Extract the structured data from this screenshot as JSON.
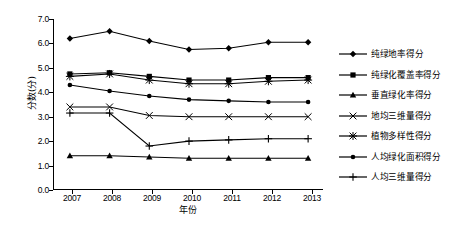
{
  "chart_data": {
    "type": "line",
    "title": "",
    "xlabel": "年份",
    "ylabel": "分数(分)",
    "categories": [
      "2007",
      "2008",
      "2009",
      "2010",
      "2011",
      "2012",
      "2013"
    ],
    "x": [
      2007,
      2008,
      2009,
      2010,
      2011,
      2012,
      2013
    ],
    "xlim": [
      2006.6,
      2013.4
    ],
    "ylim": [
      0.0,
      7.0
    ],
    "yticks": [
      "0.0",
      "1.0",
      "2.0",
      "3.0",
      "4.0",
      "5.0",
      "6.0",
      "7.0"
    ],
    "ytick_values": [
      0.0,
      1.0,
      2.0,
      3.0,
      4.0,
      5.0,
      6.0,
      7.0
    ],
    "grid": false,
    "legend_position": "right",
    "series": [
      {
        "name": "纯绿地率得分",
        "marker": "diamond",
        "values": [
          6.2,
          6.5,
          6.1,
          5.75,
          5.8,
          6.05,
          6.05
        ]
      },
      {
        "name": "纯绿化覆盖率得分",
        "marker": "square",
        "values": [
          4.75,
          4.8,
          4.65,
          4.5,
          4.5,
          4.6,
          4.6
        ]
      },
      {
        "name": "垂直绿化率得分",
        "marker": "triangle",
        "values": [
          1.4,
          1.4,
          1.35,
          1.3,
          1.3,
          1.3,
          1.3
        ]
      },
      {
        "name": "地均三维量得分",
        "marker": "x",
        "values": [
          3.4,
          3.4,
          3.05,
          3.0,
          3.0,
          3.0,
          3.0
        ]
      },
      {
        "name": "植物多样性得分",
        "marker": "asterisk",
        "values": [
          4.65,
          4.75,
          4.5,
          4.35,
          4.35,
          4.45,
          4.5
        ]
      },
      {
        "name": "人均绿化面积得分",
        "marker": "circle",
        "values": [
          4.3,
          4.05,
          3.85,
          3.7,
          3.65,
          3.6,
          3.6
        ]
      },
      {
        "name": "人均三维量得分",
        "marker": "plus",
        "values": [
          3.15,
          3.15,
          1.8,
          2.0,
          2.05,
          2.1,
          2.1
        ]
      }
    ]
  }
}
